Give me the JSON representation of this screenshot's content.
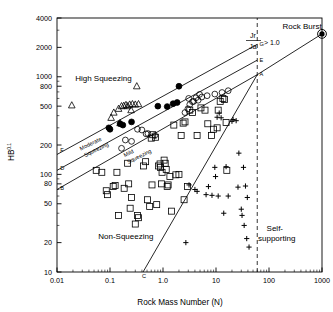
{
  "chart_data": {
    "type": "scatter",
    "title": "",
    "xlabel": "Rock Mass Number (N)",
    "ylabel": "HB",
    "ylabel_exponent": "0.1",
    "xscale": "log",
    "yscale": "log",
    "xlim": [
      0.01,
      1000
    ],
    "ylim": [
      10,
      4000
    ],
    "grid": false,
    "legend_position": "none",
    "xticks": [
      "0.01",
      "0.1",
      "1.0",
      "10",
      "100",
      "1000"
    ],
    "xtick_values": [
      0.01,
      0.1,
      1.0,
      10,
      100,
      1000
    ],
    "yticks": [
      "10",
      "20",
      "50",
      "80",
      "100",
      "200",
      "500",
      "800",
      "1000",
      "2000",
      "4000"
    ],
    "ytick_values": [
      10,
      20,
      50,
      80,
      100,
      200,
      500,
      800,
      1000,
      2000,
      4000
    ],
    "zone_labels": [
      {
        "text": "High Squeezing",
        "x": 0.022,
        "y": 900
      },
      {
        "text": "Non-Squeezing",
        "x": 0.06,
        "y": 22
      },
      {
        "text": "Rock Burst",
        "x": 180,
        "y": 3100
      },
      {
        "text": "Self-",
        "x": 90,
        "y": 26
      },
      {
        "text": "supporting",
        "x": 62,
        "y": 21
      }
    ],
    "band_labels": [
      {
        "text": "Moderate",
        "x": 0.028,
        "y": 175
      },
      {
        "text": "Squeezing",
        "x": 0.034,
        "y": 150
      },
      {
        "text": "Mild",
        "x": 0.19,
        "y": 150
      },
      {
        "text": "Squeezing",
        "x": 0.22,
        "y": 128
      }
    ],
    "annotation": {
      "numerator": "Jr",
      "denominator": "Ja",
      "relation": "> 1.0"
    },
    "node_labels": [
      {
        "text": "F",
        "x": 0.0115,
        "y": 168
      },
      {
        "text": "D",
        "x": 0.0115,
        "y": 112
      },
      {
        "text": "B",
        "x": 0.0115,
        "y": 70
      },
      {
        "text": "G",
        "x": 66,
        "y": 2050
      },
      {
        "text": "E",
        "x": 66,
        "y": 1420
      },
      {
        "text": "A",
        "x": 66,
        "y": 1010
      },
      {
        "text": "C",
        "x": 0.4,
        "y": 8.6
      }
    ],
    "boundary_lines": [
      {
        "name": "FG",
        "from": [
          0.01,
          160
        ],
        "to": [
          60,
          2150
        ],
        "style": "solid"
      },
      {
        "name": "DE",
        "from": [
          0.01,
          110
        ],
        "to": [
          60,
          1480
        ],
        "style": "solid"
      },
      {
        "name": "BA",
        "from": [
          0.01,
          70
        ],
        "to": [
          60,
          1050
        ],
        "style": "solid"
      },
      {
        "name": "self-supporting",
        "from": [
          0.42,
          10
        ],
        "to": [
          60,
          1050
        ],
        "style": "solid"
      },
      {
        "name": "rock-burst-extension",
        "from": [
          60,
          1050
        ],
        "to": [
          1000,
          2750
        ],
        "style": "solid"
      },
      {
        "name": "jr-ja-threshold",
        "from": [
          60,
          10
        ],
        "to": [
          60,
          4000
        ],
        "style": "dashed"
      }
    ],
    "series": [
      {
        "name": "open-triangle",
        "marker": "triangle",
        "filled": false,
        "points": [
          [
            0.019,
            510
          ],
          [
            0.105,
            380
          ],
          [
            0.118,
            430
          ],
          [
            0.145,
            470
          ],
          [
            0.165,
            500
          ],
          [
            0.182,
            505
          ],
          [
            0.2,
            515
          ],
          [
            0.215,
            500
          ],
          [
            0.235,
            520
          ],
          [
            0.265,
            525
          ],
          [
            0.3,
            520
          ],
          [
            0.345,
            525
          ],
          [
            0.32,
            800
          ],
          [
            0.155,
            335
          ],
          [
            0.25,
            455
          ]
        ]
      },
      {
        "name": "filled-circle",
        "marker": "circle",
        "filled": true,
        "points": [
          [
            0.1,
            290
          ],
          [
            0.155,
            330
          ],
          [
            0.175,
            320
          ],
          [
            0.255,
            345
          ],
          [
            0.8,
            500
          ],
          [
            1.2,
            495
          ],
          [
            1.55,
            530
          ],
          [
            1.85,
            545
          ],
          [
            2.0,
            800
          ],
          [
            0.095,
            300
          ]
        ]
      },
      {
        "name": "open-circle",
        "marker": "circle",
        "filled": false,
        "points": [
          [
            0.165,
            185
          ],
          [
            0.195,
            225
          ],
          [
            0.255,
            218
          ],
          [
            0.33,
            290
          ],
          [
            0.4,
            285
          ],
          [
            0.48,
            260
          ],
          [
            0.52,
            262
          ],
          [
            0.7,
            250
          ],
          [
            2.6,
            430
          ],
          [
            2.95,
            470
          ],
          [
            3.2,
            520
          ],
          [
            3.6,
            555
          ],
          [
            3.8,
            560
          ],
          [
            4.2,
            610
          ],
          [
            4.6,
            575
          ],
          [
            5.4,
            620
          ],
          [
            6.8,
            640
          ],
          [
            9.5,
            665
          ],
          [
            13.0,
            690
          ],
          [
            17.0,
            720
          ],
          [
            3.05,
            600
          ],
          [
            4.9,
            660
          ]
        ]
      },
      {
        "name": "open-square",
        "marker": "square",
        "filled": false,
        "points": [
          [
            0.055,
            110
          ],
          [
            0.07,
            105
          ],
          [
            0.085,
            68
          ],
          [
            0.09,
            62
          ],
          [
            0.115,
            75
          ],
          [
            0.125,
            77
          ],
          [
            0.135,
            105
          ],
          [
            0.145,
            38
          ],
          [
            0.185,
            72
          ],
          [
            0.215,
            130
          ],
          [
            0.225,
            80
          ],
          [
            0.24,
            45
          ],
          [
            0.255,
            58
          ],
          [
            0.3,
            31
          ],
          [
            0.33,
            38
          ],
          [
            0.345,
            36
          ],
          [
            0.43,
            122
          ],
          [
            0.47,
            135
          ],
          [
            0.51,
            55
          ],
          [
            0.56,
            47
          ],
          [
            0.6,
            235
          ],
          [
            0.64,
            255
          ],
          [
            0.72,
            240
          ],
          [
            0.76,
            49
          ],
          [
            0.82,
            122
          ],
          [
            0.88,
            128
          ],
          [
            0.9,
            118
          ],
          [
            0.94,
            80
          ],
          [
            0.96,
            105
          ],
          [
            1.05,
            140
          ],
          [
            1.1,
            130
          ],
          [
            1.15,
            112
          ],
          [
            1.2,
            75
          ],
          [
            1.25,
            78
          ],
          [
            1.35,
            95
          ],
          [
            1.6,
            320
          ],
          [
            1.75,
            99
          ],
          [
            2.2,
            250
          ],
          [
            2.4,
            335
          ],
          [
            2.6,
            345
          ],
          [
            2.9,
            75
          ],
          [
            3.2,
            455
          ],
          [
            3.6,
            430
          ],
          [
            4.4,
            250
          ],
          [
            5.2,
            480
          ],
          [
            6.2,
            455
          ],
          [
            7.0,
            330
          ],
          [
            8.2,
            250
          ],
          [
            9.0,
            290
          ],
          [
            10.5,
            300
          ],
          [
            11.0,
            455
          ],
          [
            12.0,
            560
          ],
          [
            13.5,
            600
          ],
          [
            14.5,
            585
          ],
          [
            15.5,
            340
          ],
          [
            16.0,
            110
          ],
          [
            2.0,
            100
          ],
          [
            0.62,
            78
          ],
          [
            1.45,
            42
          ],
          [
            2.5,
            55
          ]
        ]
      },
      {
        "name": "plus",
        "marker": "plus",
        "filled": false,
        "points": [
          [
            2.7,
            20
          ],
          [
            3.1,
            78
          ],
          [
            4.0,
            70
          ],
          [
            4.4,
            67
          ],
          [
            6.5,
            62
          ],
          [
            7.2,
            75
          ],
          [
            8.4,
            61
          ],
          [
            9.5,
            118
          ],
          [
            9.8,
            95
          ],
          [
            10.5,
            385
          ],
          [
            11.5,
            425
          ],
          [
            12.5,
            380
          ],
          [
            14.0,
            40
          ],
          [
            15.5,
            120
          ],
          [
            20.0,
            350
          ],
          [
            21.0,
            365
          ],
          [
            24.0,
            355
          ],
          [
            27.0,
            165
          ],
          [
            30.0,
            44
          ],
          [
            31.0,
            38
          ],
          [
            33.0,
            118
          ],
          [
            34.0,
            30
          ],
          [
            36.0,
            76
          ],
          [
            38.0,
            22
          ],
          [
            39.0,
            58
          ],
          [
            42.0,
            18
          ],
          [
            11.0,
            60
          ],
          [
            17.0,
            60
          ],
          [
            26.0,
            74
          ]
        ]
      },
      {
        "name": "rock-burst-point",
        "marker": "circle-target",
        "filled": true,
        "points": [
          [
            1000,
            2750
          ]
        ]
      }
    ]
  }
}
